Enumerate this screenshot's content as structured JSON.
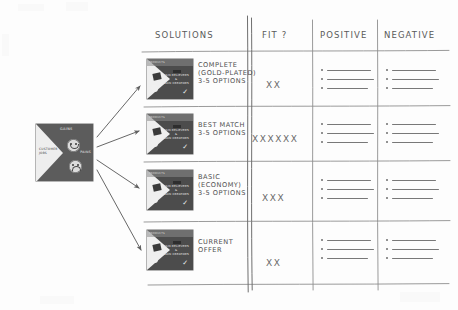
{
  "table": {
    "headers": [
      {
        "key": "solutions",
        "label": "SOLUTIONS"
      },
      {
        "key": "fit",
        "label": "FIT ?"
      },
      {
        "key": "positive",
        "label": "POSITIVE"
      },
      {
        "key": "negative",
        "label": "NEGATIVE"
      }
    ],
    "rows": [
      {
        "id": "row-complete",
        "label_lines": [
          "COMPLETE",
          "(GOLD-PLATED)",
          "3-5 OPTIONS"
        ],
        "fit": "XX",
        "fit_count": 2,
        "positive_bullets": 3,
        "negative_bullets": 3
      },
      {
        "id": "row-best-match",
        "label_lines": [
          "BEST MATCH",
          "3-5 OPTIONS"
        ],
        "fit": "XXXXXX",
        "fit_count": 6,
        "positive_bullets": 3,
        "negative_bullets": 3
      },
      {
        "id": "row-basic",
        "label_lines": [
          "BASIC",
          "(ECONOMY)",
          "3-5 OPTIONS"
        ],
        "fit": "XXX",
        "fit_count": 3,
        "positive_bullets": 3,
        "negative_bullets": 3
      },
      {
        "id": "row-current-offer",
        "label_lines": [
          "CURRENT",
          "OFFER"
        ],
        "fit": "XX",
        "fit_count": 2,
        "positive_bullets": 3,
        "negative_bullets": 3
      }
    ]
  },
  "customer_profile": {
    "name": "customer-profile-canvas",
    "gains_label": "GAINS",
    "pains_label": "PAINS",
    "jobs_label": "CUSTOMER JOBS",
    "faces": [
      "happy-face",
      "sad-face"
    ]
  },
  "value_map_thumbnail": {
    "name": "value-map-canvas",
    "corner_label": "PRODUCTS",
    "center_label_lines": [
      "PAIN RELIEVERS",
      "&",
      "GAIN CREATORS"
    ]
  },
  "arrows": {
    "name": "fan-out-arrows",
    "count": 4,
    "description": "arrow"
  },
  "colors": {
    "ink": "#4a4a4a",
    "paper": "#fdfdfd",
    "rule": "#8c8c8c",
    "thumb_dark": "#4c4c4c",
    "thumb_light": "#efefef"
  }
}
